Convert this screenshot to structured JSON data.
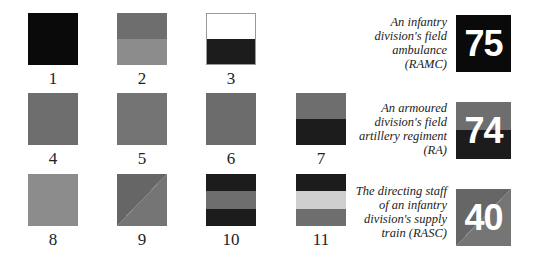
{
  "colors": {
    "black": "#0a0a0a",
    "dark": "#1c1c1c",
    "mid": "#6e6e6e",
    "mid_alt": "#727272",
    "light": "#8c8c8c",
    "pale": "#cfcfcf",
    "white": "#ffffff"
  },
  "samples": [
    {
      "label": "1",
      "pattern": "solid",
      "colors": [
        "#0a0a0a"
      ]
    },
    {
      "label": "2",
      "pattern": "horizontal-halves",
      "colors": [
        "#6e6e6e",
        "#8c8c8c"
      ]
    },
    {
      "label": "3",
      "pattern": "horizontal-halves",
      "colors": [
        "#ffffff",
        "#1c1c1c"
      ]
    },
    {
      "label": "4",
      "pattern": "solid",
      "colors": [
        "#6e6e6e"
      ]
    },
    {
      "label": "5",
      "pattern": "solid",
      "colors": [
        "#747474"
      ]
    },
    {
      "label": "6",
      "pattern": "solid",
      "colors": [
        "#6c6c6c"
      ]
    },
    {
      "label": "7",
      "pattern": "horizontal-halves",
      "colors": [
        "#6e6e6e",
        "#1c1c1c"
      ]
    },
    {
      "label": "8",
      "pattern": "solid",
      "colors": [
        "#8c8c8c"
      ]
    },
    {
      "label": "9",
      "pattern": "diagonal",
      "colors": [
        "#666666",
        "#757575"
      ]
    },
    {
      "label": "10",
      "pattern": "horizontal-thirds",
      "colors": [
        "#1c1c1c",
        "#6e6e6e",
        "#1c1c1c"
      ]
    },
    {
      "label": "11",
      "pattern": "horizontal-thirds",
      "colors": [
        "#1c1c1c",
        "#cfcfcf",
        "#6e6e6e"
      ]
    }
  ],
  "examples": [
    {
      "number": "75",
      "caption_lines": [
        "An infantry",
        "division's field",
        "ambulance",
        "(RAMC)"
      ],
      "sample": "1"
    },
    {
      "number": "74",
      "caption_lines": [
        "An armoured",
        "division's field",
        "artillery regiment",
        "(RA)"
      ],
      "sample": "7"
    },
    {
      "number": "40",
      "caption_lines": [
        "The directing staff",
        "of an infantry",
        "division's supply",
        "train (RASC)"
      ],
      "sample": "9"
    }
  ]
}
